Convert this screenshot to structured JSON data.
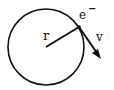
{
  "diagram": {
    "labels": {
      "radius": "r",
      "electron": "e",
      "electron_charge": "−",
      "velocity": "v"
    },
    "colors": {
      "stroke": "#111111",
      "background": "#ffffff"
    }
  }
}
